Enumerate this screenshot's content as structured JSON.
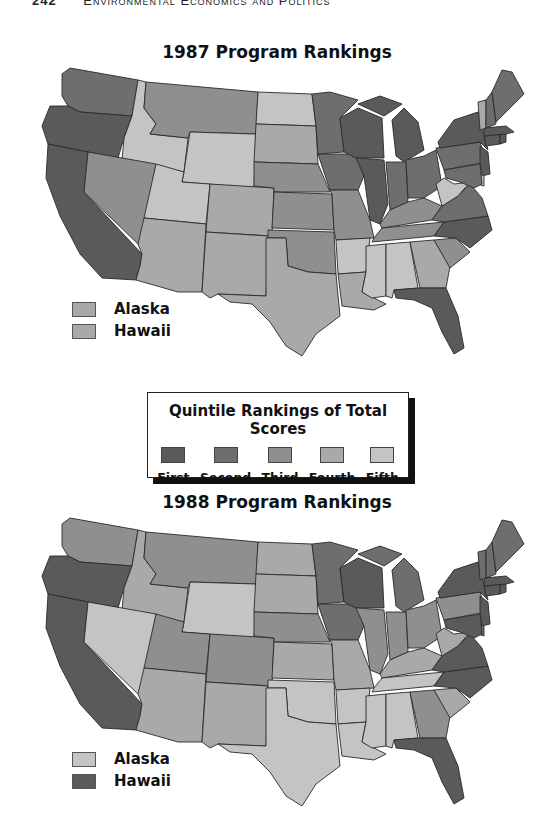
{
  "running_header": {
    "page_number": "242",
    "title": "Environmental Economics and Politics"
  },
  "legend": {
    "title": "Quintile Rankings of Total Scores",
    "items": [
      {
        "label": "First",
        "rank": 1,
        "color": "#5a5a5a"
      },
      {
        "label": "Second",
        "rank": 2,
        "color": "#6e6e6e"
      },
      {
        "label": "Third",
        "rank": 3,
        "color": "#8f8f8f"
      },
      {
        "label": "Fourth",
        "rank": 4,
        "color": "#a9a9a9"
      },
      {
        "label": "Fifth",
        "rank": 5,
        "color": "#c4c4c4"
      }
    ]
  },
  "chart_data": [
    {
      "type": "choropleth",
      "title": "1987 Program Rankings",
      "scale": "quintile (1=First ... 5=Fifth)",
      "insets": [
        {
          "label": "Alaska",
          "rank": 4
        },
        {
          "label": "Hawaii",
          "rank": 4
        }
      ],
      "states": {
        "WA": 2,
        "OR": 1,
        "CA": 1,
        "ID": 5,
        "NV": 3,
        "MT": 3,
        "WY": 5,
        "UT": 5,
        "AZ": 4,
        "CO": 4,
        "NM": 4,
        "ND": 5,
        "SD": 4,
        "NE": 3,
        "KS": 3,
        "OK": 3,
        "TX": 4,
        "MN": 2,
        "IA": 2,
        "MO": 3,
        "AR": 5,
        "LA": 4,
        "WI": 1,
        "IL": 1,
        "MI": 1,
        "IN": 2,
        "OH": 2,
        "KY": 3,
        "TN": 3,
        "MS": 5,
        "AL": 5,
        "GA": 4,
        "FL": 1,
        "SC": 3,
        "NC": 1,
        "VA": 2,
        "WV": 5,
        "PA": 2,
        "NY": 1,
        "NJ": 1,
        "DE": 5,
        "MD": 2,
        "CT": 1,
        "RI": 1,
        "MA": 1,
        "VT": 4,
        "NH": 2,
        "ME": 2
      }
    },
    {
      "type": "choropleth",
      "title": "1988 Program Rankings",
      "scale": "quintile (1=First ... 5=Fifth)",
      "insets": [
        {
          "label": "Alaska",
          "rank": 5
        },
        {
          "label": "Hawaii",
          "rank": 1
        }
      ],
      "states": {
        "WA": 3,
        "OR": 1,
        "CA": 1,
        "ID": 4,
        "NV": 5,
        "MT": 3,
        "WY": 5,
        "UT": 3,
        "AZ": 4,
        "CO": 3,
        "NM": 4,
        "ND": 4,
        "SD": 4,
        "NE": 3,
        "KS": 4,
        "OK": 5,
        "TX": 5,
        "MN": 2,
        "IA": 2,
        "MO": 4,
        "AR": 5,
        "LA": 5,
        "WI": 1,
        "IL": 3,
        "MI": 2,
        "IN": 3,
        "OH": 3,
        "KY": 4,
        "TN": 5,
        "MS": 5,
        "AL": 5,
        "GA": 3,
        "FL": 1,
        "SC": 4,
        "NC": 1,
        "VA": 1,
        "WV": 4,
        "PA": 3,
        "NY": 1,
        "NJ": 1,
        "DE": 2,
        "MD": 1,
        "CT": 1,
        "RI": 1,
        "MA": 1,
        "VT": 2,
        "NH": 2,
        "ME": 2
      }
    }
  ],
  "maps": {
    "m1987": {
      "title": "1987 Program Rankings",
      "alaska_label": "Alaska",
      "hawaii_label": "Hawaii"
    },
    "m1988": {
      "title": "1988 Program Rankings",
      "alaska_label": "Alaska",
      "hawaii_label": "Hawaii"
    }
  }
}
